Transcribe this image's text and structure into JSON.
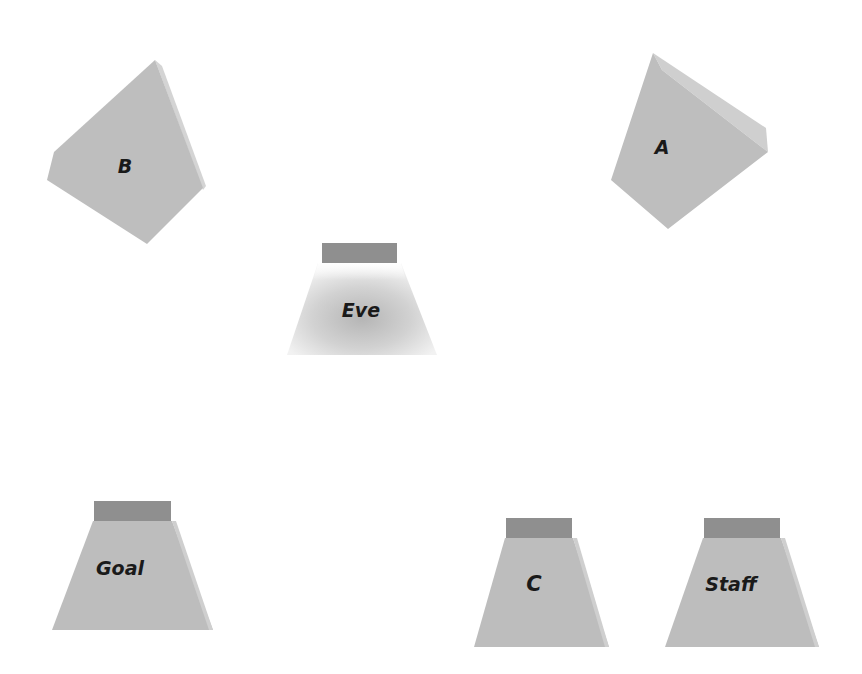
{
  "colors": {
    "background": "#ffffff",
    "face": "#bdbdbd",
    "face_light": "#c6c6c6",
    "side": "#cfcfcf",
    "top_band": "#8f8f8f",
    "label": "#1a1a1a"
  },
  "shapes": [
    {
      "id": "B",
      "label": "B",
      "kind": "tetrahedron-piece"
    },
    {
      "id": "A",
      "label": "A",
      "kind": "tetrahedron-piece"
    },
    {
      "id": "Eve",
      "label": "Eve",
      "kind": "trapezoid-block"
    },
    {
      "id": "Goal",
      "label": "Goal",
      "kind": "trapezoid-block"
    },
    {
      "id": "C",
      "label": "C",
      "kind": "trapezoid-block"
    },
    {
      "id": "Staff",
      "label": "Staff",
      "kind": "trapezoid-block"
    }
  ]
}
